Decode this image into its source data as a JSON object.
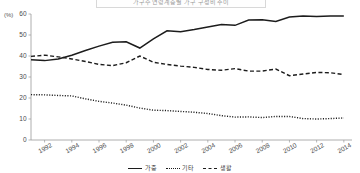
{
  "chart_data": {
    "type": "line",
    "title": "가구주 연령계층별 가구 구성비 추이",
    "xlabel": "",
    "ylabel": "(%)",
    "unit_label": "(%)",
    "x": [
      1991,
      1992,
      1993,
      1994,
      1995,
      1996,
      1997,
      1998,
      1999,
      2000,
      2001,
      2002,
      2003,
      2004,
      2005,
      2006,
      2007,
      2008,
      2009,
      2010,
      2011,
      2012,
      2013,
      2014
    ],
    "xlim": [
      1991,
      2014.6
    ],
    "ylim": [
      0,
      60
    ],
    "y_ticks": [
      0,
      10,
      20,
      30,
      40,
      50,
      60
    ],
    "x_ticks": [
      1992,
      1994,
      1996,
      1998,
      2000,
      2002,
      2004,
      2006,
      2008,
      2010,
      2012,
      2014
    ],
    "grid": false,
    "legend_position": "bottom",
    "series": [
      {
        "name": "가중",
        "style": "solid",
        "color": "#1c1c1c",
        "values": [
          38.2,
          37.8,
          38.6,
          40.4,
          42.6,
          44.7,
          46.5,
          46.8,
          43.8,
          48.2,
          52.0,
          51.6,
          52.6,
          53.8,
          55.0,
          54.6,
          57.1,
          57.3,
          56.4,
          58.6,
          59.0,
          58.8,
          59.0,
          59.1
        ]
      },
      {
        "name": "기타",
        "style": "dotted",
        "color": "#1c1c1c",
        "values": [
          21.6,
          21.5,
          21.2,
          21.0,
          19.6,
          18.4,
          17.6,
          16.6,
          15.2,
          14.2,
          14.0,
          13.6,
          13.2,
          12.6,
          11.6,
          10.9,
          11.0,
          10.7,
          11.2,
          11.2,
          10.2,
          10.0,
          10.2,
          10.5
        ]
      },
      {
        "name": "생활",
        "style": "dashed",
        "color": "#1c1c1c",
        "values": [
          39.8,
          40.4,
          39.6,
          38.6,
          37.4,
          36.0,
          35.4,
          36.8,
          40.0,
          37.0,
          36.0,
          35.2,
          34.6,
          33.6,
          33.2,
          34.0,
          32.8,
          32.8,
          33.8,
          30.6,
          31.4,
          32.2,
          32.0,
          31.2
        ]
      }
    ]
  },
  "axis": {
    "unit": "(%)",
    "y_tick_labels": [
      "60",
      "50",
      "40",
      "30",
      "20",
      "10",
      "0"
    ],
    "x_tick_labels": [
      "1992",
      "1994",
      "1996",
      "1998",
      "2000",
      "2002",
      "2004",
      "2006",
      "2008",
      "2010",
      "2012",
      "2014"
    ]
  },
  "legend": {
    "items": [
      {
        "label": "가중",
        "style": "solid"
      },
      {
        "label": "기타",
        "style": "dotted"
      },
      {
        "label": "생활",
        "style": "dashed"
      }
    ]
  }
}
